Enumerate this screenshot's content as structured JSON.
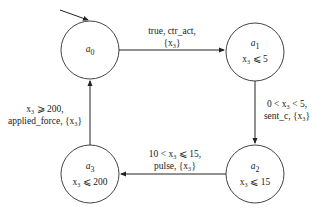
{
  "states": [
    {
      "id": "a0",
      "name": "a",
      "sub": "0",
      "invariant": ""
    },
    {
      "id": "a1",
      "name": "a",
      "sub": "1",
      "invariant": "x₃ ⩽ 5"
    },
    {
      "id": "a2",
      "name": "a",
      "sub": "2",
      "invariant": "x₃ ⩽ 15"
    },
    {
      "id": "a3",
      "name": "a",
      "sub": "3",
      "invariant": "x₃ ⩽ 200"
    }
  ],
  "transitions": [
    {
      "from": "a0",
      "to": "a1",
      "line1": "true, ctr_act,",
      "line2": "{x₃}"
    },
    {
      "from": "a1",
      "to": "a2",
      "line1": "0 < x₃ < 5,",
      "line2": "sent_c, {x₃}"
    },
    {
      "from": "a2",
      "to": "a3",
      "line1": "10 < x₃ ⩽ 15,",
      "line2": "pulse, {x₃}"
    },
    {
      "from": "a3",
      "to": "a0",
      "line1": "x₃ ⩾ 200,",
      "line2": "applied_force, {x₃}"
    }
  ],
  "initial_state": "a0"
}
